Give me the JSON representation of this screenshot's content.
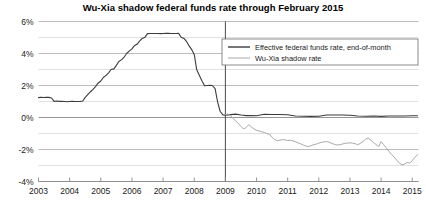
{
  "chart_data": {
    "type": "line",
    "title": "Wu-Xia shadow federal funds rate through February 2015",
    "xlabel": "",
    "ylabel": "",
    "xlim": [
      2003.0,
      2015.2
    ],
    "ylim": [
      -4,
      6
    ],
    "grid": true,
    "legend_position": "top-right",
    "y_ticks": [
      6,
      4,
      2,
      0,
      -2,
      -4
    ],
    "y_tick_labels": [
      "6%",
      "4%",
      "2%",
      "0%",
      "-2%",
      "-4%"
    ],
    "y_minor_ticks": [
      5,
      3,
      1,
      -1,
      -3
    ],
    "x_ticks": [
      2003,
      2004,
      2005,
      2006,
      2007,
      2008,
      2009,
      2010,
      2011,
      2012,
      2013,
      2014,
      2015
    ],
    "x_tick_labels": [
      "2003",
      "2004",
      "2005",
      "2006",
      "2007",
      "2008",
      "2009",
      "2010",
      "2011",
      "2012",
      "2013",
      "2014",
      "2015"
    ],
    "annotations": [
      {
        "name": "zero-lower-bound-divider",
        "type": "vline",
        "x": 2009.0
      }
    ],
    "series": [
      {
        "name": "Effective federal funds rate, end-of-month",
        "color": "#3c3c3c",
        "width": 1.1,
        "x": [
          2003.0,
          2003.08,
          2003.17,
          2003.25,
          2003.33,
          2003.42,
          2003.5,
          2003.58,
          2003.67,
          2003.75,
          2003.83,
          2003.92,
          2004.0,
          2004.08,
          2004.17,
          2004.25,
          2004.33,
          2004.42,
          2004.5,
          2004.58,
          2004.67,
          2004.75,
          2004.83,
          2004.92,
          2005.0,
          2005.08,
          2005.17,
          2005.25,
          2005.33,
          2005.42,
          2005.5,
          2005.58,
          2005.67,
          2005.75,
          2005.83,
          2005.92,
          2006.0,
          2006.08,
          2006.17,
          2006.25,
          2006.33,
          2006.42,
          2006.5,
          2006.58,
          2006.67,
          2006.75,
          2006.83,
          2006.92,
          2007.0,
          2007.08,
          2007.17,
          2007.25,
          2007.33,
          2007.42,
          2007.5,
          2007.58,
          2007.67,
          2007.75,
          2007.83,
          2007.92,
          2008.0,
          2008.08,
          2008.17,
          2008.25,
          2008.33,
          2008.42,
          2008.5,
          2008.58,
          2008.67,
          2008.75,
          2008.83,
          2008.92,
          2009.0,
          2009.17,
          2009.33,
          2009.5,
          2009.67,
          2009.83,
          2010.0,
          2010.25,
          2010.5,
          2010.75,
          2011.0,
          2011.25,
          2011.5,
          2011.75,
          2012.0,
          2012.25,
          2012.5,
          2012.75,
          2013.0,
          2013.25,
          2013.5,
          2013.75,
          2014.0,
          2014.25,
          2014.5,
          2014.75,
          2015.0,
          2015.17
        ],
        "y": [
          1.24,
          1.26,
          1.25,
          1.26,
          1.26,
          1.22,
          1.01,
          1.03,
          1.01,
          1.01,
          1.0,
          0.98,
          1.0,
          1.01,
          1.0,
          1.0,
          1.0,
          1.03,
          1.26,
          1.43,
          1.61,
          1.76,
          1.93,
          2.16,
          2.28,
          2.5,
          2.63,
          2.79,
          3.0,
          3.04,
          3.26,
          3.5,
          3.62,
          3.78,
          4.0,
          4.16,
          4.29,
          4.49,
          4.59,
          4.79,
          4.94,
          5.02,
          5.24,
          5.25,
          5.25,
          5.25,
          5.25,
          5.24,
          5.25,
          5.26,
          5.26,
          5.25,
          5.25,
          5.25,
          5.26,
          5.02,
          4.94,
          4.76,
          4.49,
          4.24,
          3.94,
          2.98,
          2.61,
          2.28,
          1.98,
          2.0,
          2.01,
          2.0,
          1.81,
          0.97,
          0.39,
          0.16,
          0.15,
          0.18,
          0.21,
          0.16,
          0.12,
          0.12,
          0.11,
          0.2,
          0.19,
          0.19,
          0.17,
          0.09,
          0.08,
          0.07,
          0.08,
          0.16,
          0.16,
          0.16,
          0.14,
          0.09,
          0.08,
          0.09,
          0.07,
          0.09,
          0.09,
          0.09,
          0.11,
          0.11
        ]
      },
      {
        "name": "Wu-Xia shadow rate",
        "color": "#a8a8a8",
        "width": 1.0,
        "x": [
          2009.0,
          2009.08,
          2009.17,
          2009.25,
          2009.33,
          2009.42,
          2009.5,
          2009.58,
          2009.67,
          2009.75,
          2009.83,
          2009.92,
          2010.0,
          2010.08,
          2010.17,
          2010.25,
          2010.33,
          2010.42,
          2010.5,
          2010.58,
          2010.67,
          2010.75,
          2010.83,
          2010.92,
          2011.0,
          2011.08,
          2011.17,
          2011.25,
          2011.33,
          2011.42,
          2011.5,
          2011.58,
          2011.67,
          2011.75,
          2011.83,
          2011.92,
          2012.0,
          2012.08,
          2012.17,
          2012.25,
          2012.33,
          2012.42,
          2012.5,
          2012.58,
          2012.67,
          2012.75,
          2012.83,
          2012.92,
          2013.0,
          2013.08,
          2013.17,
          2013.25,
          2013.33,
          2013.42,
          2013.5,
          2013.58,
          2013.67,
          2013.75,
          2013.83,
          2013.92,
          2014.0,
          2014.08,
          2014.17,
          2014.25,
          2014.33,
          2014.42,
          2014.5,
          2014.58,
          2014.67,
          2014.75,
          2014.83,
          2014.92,
          2015.0,
          2015.08,
          2015.17
        ],
        "y": [
          0.18,
          0.22,
          0.1,
          -0.05,
          -0.22,
          -0.38,
          -0.55,
          -0.72,
          -0.62,
          -0.45,
          -0.58,
          -0.72,
          -0.8,
          -0.84,
          -0.9,
          -0.93,
          -1.0,
          -1.05,
          -1.25,
          -1.38,
          -1.44,
          -1.42,
          -1.38,
          -1.4,
          -1.44,
          -1.42,
          -1.46,
          -1.52,
          -1.58,
          -1.65,
          -1.72,
          -1.78,
          -1.82,
          -1.76,
          -1.7,
          -1.66,
          -1.6,
          -1.56,
          -1.52,
          -1.5,
          -1.55,
          -1.62,
          -1.68,
          -1.72,
          -1.7,
          -1.66,
          -1.62,
          -1.6,
          -1.58,
          -1.6,
          -1.64,
          -1.7,
          -1.62,
          -1.5,
          -1.36,
          -1.28,
          -1.42,
          -1.56,
          -1.68,
          -1.82,
          -1.5,
          -1.7,
          -1.9,
          -2.12,
          -2.3,
          -2.48,
          -2.66,
          -2.84,
          -2.96,
          -2.92,
          -2.82,
          -2.84,
          -2.7,
          -2.5,
          -2.32
        ]
      }
    ]
  },
  "legend": {
    "items": [
      {
        "label": "Effective federal funds rate, end-of-month",
        "color": "#3c3c3c"
      },
      {
        "label": "Wu-Xia shadow rate",
        "color": "#a8a8a8"
      }
    ]
  }
}
